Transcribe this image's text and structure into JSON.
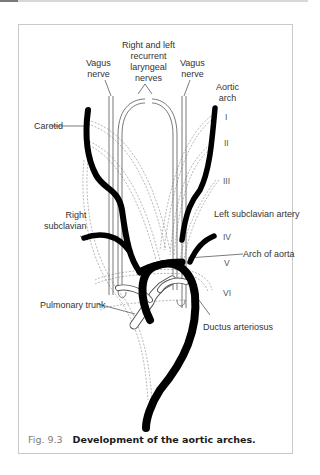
{
  "figure": {
    "number": "Fig. 9.3",
    "title": "Development of the aortic arches."
  },
  "labels": {
    "vagus_left": "Vagus\nnerve",
    "recurrent": "Right and left\nrecurrent\nlaryngeal\nnerves",
    "vagus_right": "Vagus\nnerve",
    "aortic_arch": "Aortic\narch",
    "carotid": "Carotid",
    "right_subclavian": "Right\nsubclavian",
    "left_subclavian": "Left subclavian artery",
    "arch_of_aorta": "Arch of aorta",
    "pulmonary_trunk": "Pulmonary trunk",
    "ductus": "Ductus arteriosus"
  },
  "arch_numerals": [
    "I",
    "II",
    "III",
    "IV",
    "V",
    "VI"
  ],
  "colors": {
    "vessel": "#000000",
    "outline": "#555555",
    "dashed": "#9a9a9a",
    "frame": "#c9c9c9",
    "caption_num": "#7d7d7d"
  }
}
